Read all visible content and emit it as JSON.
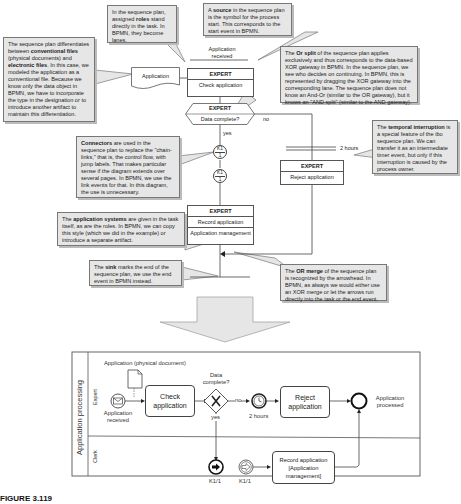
{
  "notes": {
    "roles": {
      "pre": "In the sequence plan, assigned ",
      "bold": "roles",
      "post": " stand directly in the task. In BPMN, they become lanes."
    },
    "source": {
      "pre": "A ",
      "bold": "source",
      "post": " in the sequence plan is the symbol for the process start. This corresponds to the start event in BPMN."
    },
    "files": {
      "pre": "The sequence plan differentiates between ",
      "bold1": "conventional files",
      "mid": " (physical documents) and ",
      "bold2": "electronic files",
      "post": ". In this case, we modeled the application as a conventional file. Because we know only the data object in BPMN, we have to incorporate the type in the designation or to introduce another artifact to maintain this differentiation."
    },
    "or_split": {
      "pre": "The ",
      "bold": "Or split",
      "post": " of the sequence plan applies exclusively and thus corresponds to the data-based XOR gateway in BPMN. In the sequence plan, we see who decides on continuing. In BPMN, this is represented by dragging the XOR gateway into the corresponding lane. The sequence plan does not know an And-Or (similar to the OR gateway), but it knows an \"AND split\" (similar to the AND gateway)."
    },
    "temporal": {
      "pre": "The ",
      "bold": "temporal interruption",
      "post": " is a special feature of the ibo sequence plan. We can transfer it as an intermediate timer event, but only if this interruption is caused by the process owner."
    },
    "connectors": {
      "bold": "Connectors",
      "post": " are used in the sequence plan to replace the \"chain-links,\" that is, the control flow, with jump labels. That makes particular sense if the diagram extends over several pages. In BPMN, we use the link events for that. In this diagram, the use is unnecessary."
    },
    "app_systems": {
      "pre": "The ",
      "bold": "application systems",
      "post": " are given in the task itself, as are the roles. In BPMN, we can copy this style (which we did in the example) or introduce a separate artifact."
    },
    "sink": {
      "pre": "The ",
      "bold": "sink",
      "post": " marks the end of the sequence plan, we use the end event in BPMN instead."
    },
    "or_merge": {
      "pre": "The ",
      "bold": "OR merge",
      "post": " of the sequence plan is recognized by the arrowhead. In BPMN, as always we would either use an XOR merge or let the arrows run directly into the task or the end event."
    }
  },
  "sequence_plan": {
    "source_label": "Application received",
    "document_label": "Application",
    "check_task": {
      "role": "EXPERT",
      "name": "Check application"
    },
    "decision": {
      "role": "EXPERT",
      "name": "Data complete?",
      "yes": "yes",
      "no": "no"
    },
    "timer_label": "2 hours",
    "reject_task": {
      "role": "EXPERT",
      "name": "Reject application"
    },
    "connector": {
      "top": "K1",
      "bottom": "1"
    },
    "record_task": {
      "role": "EXPERT",
      "name": "Record application",
      "system": "Application management"
    }
  },
  "bpmn": {
    "pool_label": "Application processing",
    "lanes": [
      "Expert",
      "Clerk"
    ],
    "data_object_label": "Application (physical document)",
    "start_label": "Application received",
    "check_task": "Check application",
    "gateway_label": "Data complete?",
    "gateway_no": "no",
    "gateway_yes": "yes",
    "timer_label": "2 hours",
    "reject_task": "Reject application",
    "end_label": "Application processed",
    "link_throw_label": "K1/1",
    "link_catch_label": "K1/1",
    "record_task": "Record application [Application management]"
  },
  "caption": "FIGURE 3.119"
}
